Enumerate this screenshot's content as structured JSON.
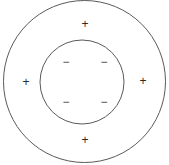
{
  "figure": {
    "background_color": "#ffffff",
    "stroke_color": "#5a5a5a",
    "width": 169,
    "height": 165
  },
  "chart_data": {
    "type": "scatter",
    "title": "",
    "subtitle": "",
    "xlabel": "",
    "ylabel": "",
    "xlim": [
      0,
      169
    ],
    "ylim": [
      0,
      165
    ],
    "grid": false,
    "legend": "none",
    "shapes": [
      {
        "name": "outer-circle",
        "type": "circle",
        "cx": 84.5,
        "cy": 81.5,
        "r": 81,
        "fill": "none",
        "stroke": "#5a5a5a",
        "stroke_width": 1
      },
      {
        "name": "inner-circle",
        "type": "circle",
        "cx": 82,
        "cy": 82,
        "r": 42,
        "fill": "none",
        "stroke": "#5a5a5a",
        "stroke_width": 1
      }
    ],
    "annotations": [
      {
        "name": "plus-top",
        "label": "+",
        "x": 85,
        "y": 24,
        "region": "annulus"
      },
      {
        "name": "plus-left",
        "label": "+",
        "x": 26,
        "y": 82,
        "region": "annulus"
      },
      {
        "name": "plus-right",
        "label": "+",
        "x": 143,
        "y": 81,
        "region": "annulus"
      },
      {
        "name": "plus-bottom",
        "label": "+",
        "x": 85,
        "y": 140,
        "region": "annulus"
      },
      {
        "name": "minus-top-left",
        "label": "−",
        "x": 66,
        "y": 62,
        "region": "inner"
      },
      {
        "name": "minus-top-right",
        "label": "−",
        "x": 104,
        "y": 62,
        "region": "inner"
      },
      {
        "name": "minus-bottom-left",
        "label": "−",
        "x": 66,
        "y": 102,
        "region": "inner"
      },
      {
        "name": "minus-bottom-right",
        "label": "−",
        "x": 104,
        "y": 102,
        "region": "inner"
      }
    ],
    "counts": {
      "positive_charges": 4,
      "negative_charges": 4
    }
  },
  "signs": {
    "plus_top": "+",
    "plus_left": "+",
    "plus_right": "+",
    "plus_bottom": "+",
    "minus_top_left": "−",
    "minus_top_right": "−",
    "minus_bottom_left": "−",
    "minus_bottom_right": "−"
  }
}
